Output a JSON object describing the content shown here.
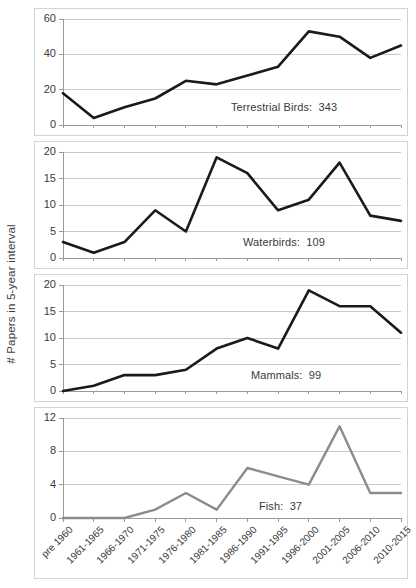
{
  "chart_data": {
    "type": "line",
    "title": "",
    "subtitle": "",
    "xlabel": "",
    "ylabel": "# Papers in 5-year interval",
    "grid": true,
    "legend_position": "inside-panel-annotation",
    "categories": [
      "pre 1960",
      "1961-1965",
      "1966-1970",
      "1971-1975",
      "1976-1980",
      "1981-1985",
      "1986-1990",
      "1991-1995",
      "1996-2000",
      "2001-2005",
      "2006-2010",
      "2010-2015"
    ],
    "panels": [
      {
        "name": "Terrestrial Birds",
        "annotation": "Terrestrial Birds:  343",
        "total": 343,
        "line_color": "#1a1a1a",
        "line_width": 2.6,
        "ylim": [
          0,
          60
        ],
        "yticks": [
          0,
          20,
          40,
          60
        ],
        "values": [
          18,
          4,
          10,
          15,
          25,
          23,
          28,
          33,
          53,
          50,
          38,
          45
        ]
      },
      {
        "name": "Waterbirds",
        "annotation": "Waterbirds:  109",
        "total": 109,
        "line_color": "#1a1a1a",
        "line_width": 2.6,
        "ylim": [
          0,
          20
        ],
        "yticks": [
          0,
          5,
          10,
          15,
          20
        ],
        "values": [
          3,
          1,
          3,
          9,
          5,
          19,
          16,
          9,
          11,
          18,
          8,
          7
        ]
      },
      {
        "name": "Mammals",
        "annotation": "Mammals:  99",
        "total": 99,
        "line_color": "#1a1a1a",
        "line_width": 2.6,
        "ylim": [
          0,
          20
        ],
        "yticks": [
          0,
          5,
          10,
          15,
          20
        ],
        "values": [
          0,
          1,
          3,
          3,
          4,
          8,
          10,
          8,
          19,
          16,
          16,
          11
        ]
      },
      {
        "name": "Fish",
        "annotation": "Fish:  37",
        "total": 37,
        "line_color": "#8c8c8c",
        "line_width": 2.4,
        "ylim": [
          0,
          12
        ],
        "yticks": [
          0,
          4,
          8,
          12
        ],
        "values": [
          0,
          0,
          0,
          1,
          3,
          1,
          6,
          5,
          4,
          11,
          3,
          3
        ]
      }
    ],
    "colors": {
      "grid": "#c9c9c9",
      "axis": "#9a9a9a",
      "panel_border": "#d4d4d4",
      "text": "#3a3a3a",
      "background": "#ffffff"
    }
  }
}
